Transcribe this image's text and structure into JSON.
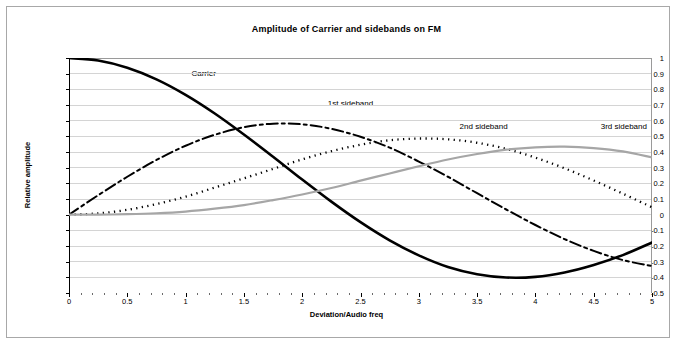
{
  "chart_data": {
    "type": "line",
    "title": "Amplitude of Carrier and sidebands on FM",
    "xlabel": "Deviation/Audio freq",
    "ylabel": "Relative amplitude",
    "xlim": [
      0,
      5
    ],
    "ylim": [
      -0.5,
      1
    ],
    "grid": true,
    "legend_position": "inline-annotations",
    "x_ticks": [
      "0",
      "0.5",
      "1",
      "1.5",
      "2",
      "2.5",
      "3",
      "3.5",
      "4",
      "4.5",
      "5"
    ],
    "y_ticks": [
      "1",
      "0.9",
      "0.8",
      "0.7",
      "0.6",
      "0.5",
      "0.4",
      "0.3",
      "0.2",
      "0.1",
      "0",
      "-0.1",
      "-0.2",
      "-0.3",
      "-0.4",
      "-0.5"
    ],
    "x": [
      0,
      0.25,
      0.5,
      0.75,
      1,
      1.25,
      1.5,
      1.75,
      2,
      2.25,
      2.5,
      2.75,
      3,
      3.25,
      3.5,
      3.75,
      4,
      4.25,
      4.5,
      4.75,
      5
    ],
    "series": [
      {
        "name": "Carrier",
        "style": "solid",
        "color": "#000000",
        "width": 2.6,
        "label_x": 1.05,
        "label_y": 0.89,
        "values": [
          1.0,
          0.984,
          0.938,
          0.864,
          0.765,
          0.646,
          0.512,
          0.37,
          0.224,
          0.083,
          -0.048,
          -0.164,
          -0.26,
          -0.334,
          -0.38,
          -0.401,
          -0.397,
          -0.369,
          -0.321,
          -0.258,
          -0.178
        ]
      },
      {
        "name": "1st sideband",
        "style": "dashdot",
        "color": "#000000",
        "width": 2.0,
        "label_x": 2.22,
        "label_y": 0.7,
        "values": [
          0.0,
          0.124,
          0.242,
          0.349,
          0.44,
          0.51,
          0.558,
          0.581,
          0.577,
          0.548,
          0.497,
          0.428,
          0.339,
          0.242,
          0.137,
          0.033,
          -0.066,
          -0.156,
          -0.231,
          -0.29,
          -0.328
        ]
      },
      {
        "name": "2nd sideband",
        "style": "dotted",
        "color": "#000000",
        "width": 2.3,
        "label_x": 3.35,
        "label_y": 0.555,
        "values": [
          0.0,
          0.008,
          0.031,
          0.068,
          0.115,
          0.173,
          0.232,
          0.292,
          0.353,
          0.405,
          0.446,
          0.475,
          0.486,
          0.481,
          0.459,
          0.42,
          0.364,
          0.296,
          0.218,
          0.134,
          0.047
        ]
      },
      {
        "name": "3rd sideband",
        "style": "solid",
        "color": "#a6a6a6",
        "width": 2.2,
        "label_x": 4.56,
        "label_y": 0.555,
        "values": [
          0.0,
          0.0,
          0.003,
          0.009,
          0.02,
          0.038,
          0.061,
          0.093,
          0.129,
          0.17,
          0.217,
          0.263,
          0.309,
          0.352,
          0.387,
          0.415,
          0.43,
          0.434,
          0.425,
          0.404,
          0.365
        ]
      }
    ]
  }
}
